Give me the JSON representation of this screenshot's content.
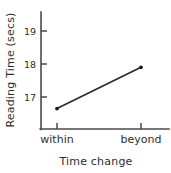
{
  "chart_data": {
    "type": "line",
    "title": "",
    "subtitle": "",
    "xlabel": "Time change",
    "ylabel": "Reading Time (secs)",
    "categories": [
      "within",
      "beyond"
    ],
    "values": [
      16.65,
      17.9
    ],
    "series": [
      {
        "name": "Reading time",
        "values": [
          16.65,
          17.9
        ]
      }
    ],
    "ytick_labels": [
      "17",
      "18",
      "19"
    ],
    "ytick_values": [
      17,
      18,
      19
    ],
    "xtick_labels": [
      "within",
      "beyond"
    ],
    "ylim": [
      16.25,
      19.35
    ],
    "xlim": [
      0,
      1
    ],
    "grid": false,
    "legend": false,
    "legend_position": "none",
    "markers": "filled-dot",
    "line_color": "#2a2a2a",
    "axis_color": "#4a4a4a",
    "background_color": "#ffffff",
    "annotations": []
  },
  "labels": {
    "y_axis_title": "Reading Time (secs)",
    "x_axis_title": "Time change",
    "ytick_17": "17",
    "ytick_18": "18",
    "ytick_19": "19",
    "xtick_within": "within",
    "xtick_beyond": "beyond"
  }
}
